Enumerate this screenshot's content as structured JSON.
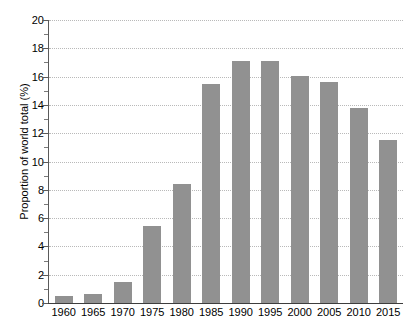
{
  "chart_data": {
    "type": "bar",
    "title": "",
    "subtitle": "",
    "xlabel": "",
    "ylabel": "Proportion of world total (%)",
    "categories": [
      "1960",
      "1965",
      "1970",
      "1975",
      "1980",
      "1985",
      "1990",
      "1995",
      "2000",
      "2005",
      "2010",
      "2015"
    ],
    "values": [
      0.5,
      0.65,
      1.5,
      5.45,
      8.4,
      15.5,
      17.1,
      17.1,
      16.05,
      15.65,
      13.8,
      11.5
    ],
    "ylim": [
      0,
      20
    ],
    "y_major_ticks": [
      0,
      2,
      4,
      6,
      8,
      10,
      12,
      14,
      16,
      18,
      20
    ],
    "y_minor_ticks": [
      1,
      3,
      5,
      7,
      9,
      11,
      13,
      15,
      17,
      19
    ],
    "y_tick_labels": [
      "0",
      "2",
      "4",
      "6",
      "8",
      "10",
      "12",
      "14",
      "16",
      "18",
      "20"
    ],
    "grid": true,
    "grid_style": "dotted",
    "legend": null,
    "bar_color": "#919191",
    "gridline_color": "#b9b9b9",
    "axis_color": "#3d3d3d",
    "background_color": "#ffffff",
    "bar_width_fraction": 0.62
  }
}
